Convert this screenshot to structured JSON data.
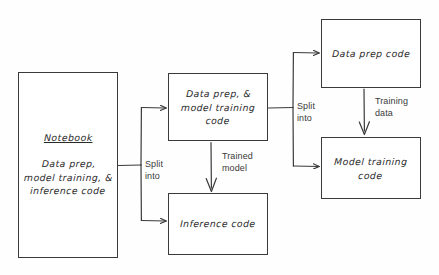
{
  "diagram": {
    "background_color": "#fefefe",
    "stroke_color": "#3a3a3a",
    "text_color": "#2b2b2b",
    "nodes": [
      {
        "id": "notebook",
        "name": "notebook-box",
        "heading": "Notebook",
        "body": "Data prep,\nmodel training, &\ninference code",
        "x": 18,
        "y": 72,
        "w": 100,
        "h": 186
      },
      {
        "id": "data-prep-model-training",
        "name": "data-prep-model-training-box",
        "body": "Data prep, &\nmodel training\ncode",
        "x": 168,
        "y": 73,
        "w": 100,
        "h": 68
      },
      {
        "id": "inference-code",
        "name": "inference-code-box",
        "body": "Inference code",
        "x": 168,
        "y": 193,
        "w": 100,
        "h": 62
      },
      {
        "id": "data-prep-code",
        "name": "data-prep-code-box",
        "body": "Data prep code",
        "x": 321,
        "y": 19,
        "w": 100,
        "h": 69
      },
      {
        "id": "model-training-code",
        "name": "model-training-code-box",
        "body": "Model training\ncode",
        "x": 321,
        "y": 137,
        "w": 100,
        "h": 62
      }
    ],
    "edge_labels": [
      {
        "id": "split-into-left",
        "name": "split-into-left-label",
        "text": "Split\ninto",
        "x": 145,
        "y": 159
      },
      {
        "id": "trained-model",
        "name": "trained-model-label",
        "text": "Trained\nmodel",
        "x": 222,
        "y": 151
      },
      {
        "id": "split-into-right",
        "name": "split-into-right-label",
        "text": "Split\ninto",
        "x": 297,
        "y": 101
      },
      {
        "id": "training-data",
        "name": "training-data-label",
        "text": "Training\ndata",
        "x": 375,
        "y": 96
      }
    ]
  }
}
